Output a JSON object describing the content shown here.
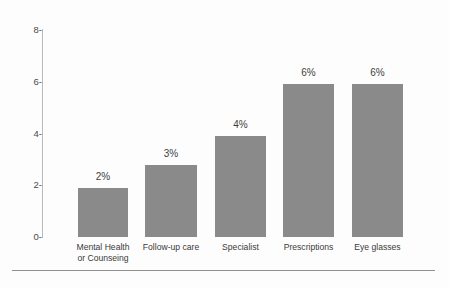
{
  "chart_data": {
    "type": "bar",
    "title": "",
    "subtitle": "",
    "xlabel": "",
    "ylabel": "",
    "ylim": [
      0,
      8
    ],
    "yticks": [
      0,
      2,
      4,
      6,
      8
    ],
    "ytick_labels": [
      "0-",
      "2-",
      "4-",
      "6-",
      "8-"
    ],
    "grid": false,
    "legend": "none",
    "orientation": "vertical",
    "bar_color": "#8a8a8a",
    "background_color": "#fdfdfd",
    "axis_color": "#b9b9b9",
    "categories": [
      "Mental Health or Counseing",
      "Follow-up care",
      "Specialist",
      "Prescriptions",
      "Eye glasses"
    ],
    "category_lines": [
      [
        "Mental Health",
        "or Counseing"
      ],
      [
        "Follow-up care"
      ],
      [
        "Specialist"
      ],
      [
        "Prescriptions"
      ],
      [
        "Eye glasses"
      ]
    ],
    "values": [
      1.9,
      2.8,
      3.9,
      5.9,
      5.9
    ],
    "data_labels": [
      "2%",
      "3%",
      "4%",
      "6%",
      "6%"
    ]
  },
  "bars": [
    {
      "label": "2%",
      "value": 1.9,
      "line1": "Mental Health",
      "line2": "or Counseing",
      "left": 78,
      "width": 50
    },
    {
      "label": "3%",
      "value": 2.8,
      "line1": "Follow-up care",
      "line2": "",
      "left": 145,
      "width": 52
    },
    {
      "label": "4%",
      "value": 3.9,
      "line1": "Specialist",
      "line2": "",
      "left": 215,
      "width": 51
    },
    {
      "label": "6%",
      "value": 5.9,
      "line1": "Prescriptions",
      "line2": "",
      "left": 283,
      "width": 51
    },
    {
      "label": "6%",
      "value": 5.9,
      "line1": "Eye glasses",
      "line2": "",
      "left": 352,
      "width": 51
    }
  ],
  "yaxis": {
    "ticks": [
      {
        "label": "8-",
        "value": 8
      },
      {
        "label": "6-",
        "value": 6
      },
      {
        "label": "4-",
        "value": 4
      },
      {
        "label": "2-",
        "value": 2
      },
      {
        "label": "0-",
        "value": 0
      }
    ]
  }
}
